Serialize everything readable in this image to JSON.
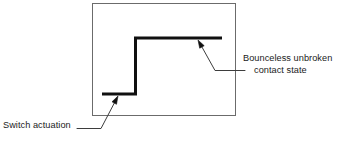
{
  "figure": {
    "type": "timing-diagram",
    "colors": {
      "background": "#ffffff",
      "frame_stroke": "#6b6b6b",
      "waveform_stroke": "#101010",
      "leader_stroke": "#3d3d3d",
      "text": "#1a1a1a"
    },
    "frame": {
      "x": 92,
      "y": 3,
      "width": 144,
      "height": 113,
      "stroke_width": 1
    },
    "waveform": {
      "stroke_width": 3,
      "low_level_y": 94,
      "high_level_y": 38,
      "low_start_x": 102,
      "transition_x": 135,
      "high_end_x": 222,
      "points": "102,94 135,94 135,38 222,38"
    },
    "annotations": [
      {
        "name": "bounceless-unbroken-contact-state",
        "line1": "Bounceless unbroken",
        "line2": "contact state",
        "arrow_tip": {
          "x": 198,
          "y": 40
        },
        "elbow": {
          "x": 215,
          "y": 70
        },
        "leader_end": {
          "x": 245,
          "y": 70
        }
      },
      {
        "name": "switch-actuation",
        "line1": "Switch actuation",
        "arrow_tip": {
          "x": 118,
          "y": 96
        },
        "elbow": {
          "x": 101,
          "y": 128
        },
        "leader_end": {
          "x": 77,
          "y": 128
        }
      }
    ]
  }
}
